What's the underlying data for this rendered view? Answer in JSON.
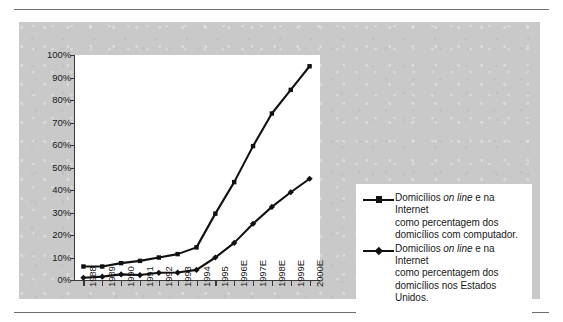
{
  "chart_data": {
    "type": "line",
    "title": "",
    "subtitle": "",
    "xlabel": "",
    "ylabel": "",
    "ylim": [
      0,
      100
    ],
    "y_tick_labels": [
      "100%",
      "90%",
      "80%",
      "70%",
      "60%",
      "50%",
      "40%",
      "30%",
      "20%",
      "10%",
      "0%"
    ],
    "y_ticks": [
      100,
      90,
      80,
      70,
      60,
      50,
      40,
      30,
      20,
      10,
      0
    ],
    "grid": false,
    "legend_position": "right",
    "categories": [
      "1988",
      "1989",
      "1990",
      "1991",
      "1992",
      "1993",
      "1994",
      "1995",
      "1996E",
      "1997E",
      "1998E",
      "1999E",
      "2000E"
    ],
    "series": [
      {
        "name": "Domicílios on line e na Internet como percentagem dos domicílios com computador.",
        "marker": "square",
        "color": "#111111",
        "values": [
          6,
          6,
          7.5,
          8.5,
          10,
          11.5,
          14.5,
          29.5,
          43.5,
          59.5,
          74,
          84.5,
          95
        ]
      },
      {
        "name": "Domicílios on line e na Internet como percentagem dos domicílios nos Estados Unidos.",
        "marker": "diamond",
        "color": "#111111",
        "values": [
          1,
          1.5,
          2.5,
          2.2,
          3.2,
          3.3,
          4.5,
          10,
          16.5,
          25,
          32.5,
          39,
          45
        ]
      }
    ]
  },
  "legend": {
    "entries": [
      {
        "line1_a": "Domicílios ",
        "line1_i": "on line",
        "line1_b": " e na Internet",
        "line2": "como percentagem dos",
        "line3": "domicílios com computador."
      },
      {
        "line1_a": "Domicílios ",
        "line1_i": "on line",
        "line1_b": " e na Internet",
        "line2": "como percentagem dos",
        "line3": "domicílios nos Estados Unidos."
      }
    ]
  },
  "colors": {
    "panel": "#c9c9c9",
    "plot_background": "#ffffff",
    "axis": "#3a3a3a",
    "series": "#111111",
    "rule": "#6f6f6f"
  }
}
